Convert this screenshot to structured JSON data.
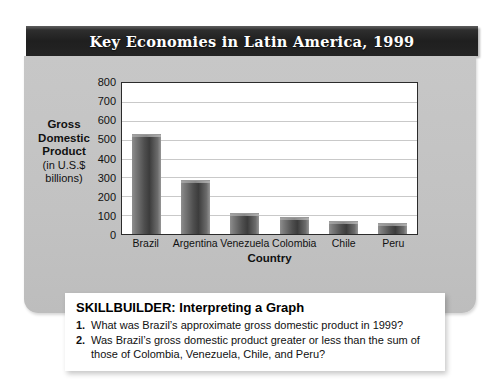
{
  "figure": {
    "title": "Key Economies in Latin America, 1999"
  },
  "chart_data": {
    "type": "bar",
    "title": "Key Economies in Latin America, 1999",
    "categories": [
      "Brazil",
      "Argentina",
      "Venezuela",
      "Colombia",
      "Chile",
      "Peru"
    ],
    "values": [
      530,
      285,
      110,
      90,
      70,
      57
    ],
    "xlabel": "Country",
    "ylabel": "Gross Domestic Product (in U.S.$ billions)",
    "ylabel_lines": [
      "Gross",
      "Domestic",
      "Product",
      "(in U.S.$",
      "billions)"
    ],
    "ylim": [
      0,
      800
    ],
    "ytick_step": 100,
    "yticks": [
      "800",
      "700",
      "600",
      "500",
      "400",
      "300",
      "200",
      "100",
      "0"
    ],
    "grid": true,
    "legend": "none",
    "bar_color": "#4f4f4f",
    "plot_bg": "#ffffff",
    "panel_bg": "#c4c4c4"
  },
  "skillbuilder": {
    "heading": "SKILLBUILDER: Interpreting a Graph",
    "items": [
      {
        "num": "1.",
        "text": "What was Brazil’s approximate gross domestic product in 1999?"
      },
      {
        "num": "2.",
        "text": "Was Brazil’s gross domestic product greater or less than the sum of those of Colombia, Venezuela, Chile, and Peru?"
      }
    ]
  }
}
